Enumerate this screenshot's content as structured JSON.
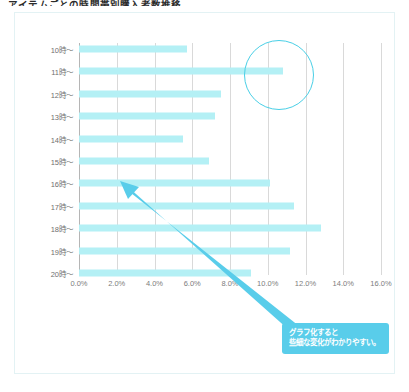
{
  "page": {
    "title": "アイテムごとの時間帯別購入者数推移"
  },
  "callout": {
    "line1": "グラフ化すると",
    "line2": "些細な変化がわかりやすい。"
  },
  "highlight": {
    "target_label": "11時〜",
    "accent_color": "#49cfe6"
  },
  "colors": {
    "bar": "#b4f0f5",
    "accent": "#59cdea",
    "gridline": "#d9d9d9",
    "axis": "#b5b5b5",
    "card_border": "#e3f2f4",
    "tick_text": "#7d7d7d",
    "label_text": "#6f6f6f"
  },
  "chart_data": {
    "type": "bar",
    "orientation": "horizontal",
    "title": "",
    "xlabel": "",
    "ylabel": "",
    "xlim": [
      0,
      16
    ],
    "xticks": [
      0,
      2,
      4,
      6,
      8,
      10,
      12,
      14,
      16
    ],
    "xtick_labels": [
      "0.0%",
      "2.0%",
      "4.0%",
      "6.0%",
      "8.0%",
      "10.0%",
      "12.0%",
      "14.0%",
      "16.0%"
    ],
    "grid": true,
    "legend": "none",
    "categories": [
      "10時〜",
      "11時〜",
      "12時〜",
      "13時〜",
      "14時〜",
      "15時〜",
      "16時〜",
      "17時〜",
      "18時〜",
      "19時〜",
      "20時〜"
    ],
    "values": [
      5.7,
      10.8,
      7.5,
      7.2,
      5.5,
      6.9,
      10.1,
      11.4,
      12.8,
      11.2,
      9.1
    ]
  }
}
